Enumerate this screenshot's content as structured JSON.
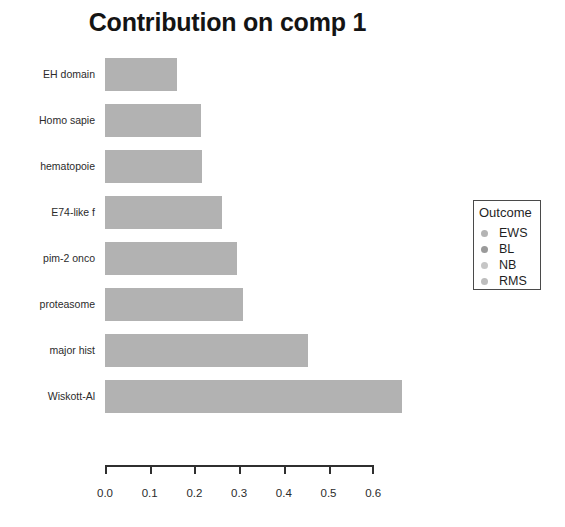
{
  "chart_data": {
    "type": "bar",
    "orientation": "horizontal",
    "title": "Contribution on comp 1",
    "xlabel": "",
    "ylabel": "",
    "xlim": [
      0.0,
      0.6
    ],
    "grid": false,
    "categories": [
      "EH domain",
      "Homo sapie",
      "hematopoie",
      "E74-like f",
      "pim-2 onco",
      "proteasome",
      "major hist",
      "Wiskott-Al"
    ],
    "values": [
      0.161,
      0.215,
      0.217,
      0.262,
      0.295,
      0.309,
      0.454,
      0.664
    ],
    "bar_color": "#b2b2b2",
    "xticks": [
      0.0,
      0.1,
      0.2,
      0.3,
      0.4,
      0.5,
      0.6
    ],
    "xtick_labels": [
      "0.0",
      "0.1",
      "0.2",
      "0.3",
      "0.4",
      "0.5",
      "0.6"
    ],
    "legend": {
      "position": "right",
      "title": "Outcome",
      "entries": [
        {
          "label": "EWS",
          "color": "#b4b4b4"
        },
        {
          "label": "BL",
          "color": "#9a9a9a"
        },
        {
          "label": "NB",
          "color": "#c6c6c6"
        },
        {
          "label": "RMS",
          "color": "#bdbdbd"
        }
      ]
    }
  }
}
